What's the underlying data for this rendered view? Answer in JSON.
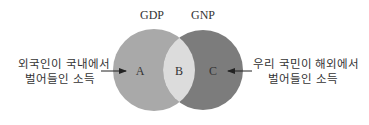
{
  "diagram": {
    "type": "venn",
    "sets": [
      {
        "id": "gdp",
        "title": "GDP",
        "color": "#a9a9a9"
      },
      {
        "id": "gnp",
        "title": "GNP",
        "color": "#7c7c7c"
      }
    ],
    "intersection_color": "#dcdcdc",
    "background_color": "#ffffff",
    "regions": {
      "a": {
        "label": "A",
        "belongs_to": "GDP only"
      },
      "b": {
        "label": "B",
        "belongs_to": "GDP and GNP"
      },
      "c": {
        "label": "C",
        "belongs_to": "GNP only"
      }
    },
    "annotations": {
      "left": {
        "line1": "외국인이 국내에서",
        "line2": "벌어들인 소득",
        "points_to": "A"
      },
      "right": {
        "line1": "우리 국민이 해외에서",
        "line2": "벌어들인 소득",
        "points_to": "C"
      }
    }
  }
}
